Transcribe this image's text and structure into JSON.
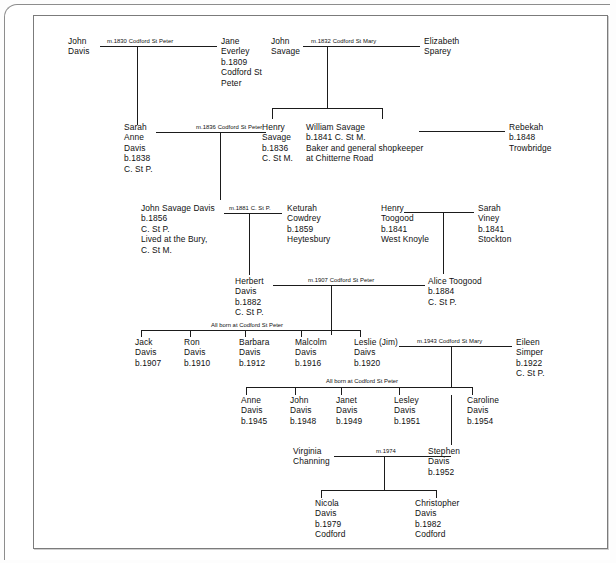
{
  "document": {
    "type": "family-tree-chart",
    "surname": "Davis",
    "title_text": ""
  },
  "generation1": {
    "john_davis": {
      "lines": [
        "John",
        "Davis"
      ]
    },
    "marriage_davis_everley": "m.1830 Codford St Peter",
    "jane_everley": {
      "lines": [
        "Jane",
        "Everley",
        "b.1809",
        "Codford St",
        "Peter"
      ]
    },
    "john_savage": {
      "lines": [
        "John",
        "Savage"
      ]
    },
    "marriage_savage_sparey": "m.1832 Codford St Mary",
    "elizabeth_sparey": {
      "lines": [
        "Elizabeth",
        "Sparey"
      ]
    }
  },
  "generation2": {
    "sarah_anne_davis": {
      "lines": [
        "Sarah",
        "Anne",
        "Davis",
        "b.1838",
        "C. St P."
      ]
    },
    "marriage_davis_savage": "m.1836 Codford St Peter",
    "henry_savage": {
      "lines": [
        "Henry",
        "Savage",
        "b.1836",
        "C. St M."
      ]
    },
    "william_savage": {
      "lines": [
        "William Savage",
        "b.1841 C. St M.",
        "Baker and general shopkeeper",
        "at Chitterne Road"
      ]
    },
    "rebekah": {
      "lines": [
        "Rebekah",
        "b.1848",
        "Trowbridge"
      ]
    }
  },
  "generation3": {
    "john_savage_davis": {
      "lines": [
        "John Savage Davis",
        "b.1856",
        "C. St P.",
        "Lived at the Bury,",
        "C. St M."
      ]
    },
    "marriage_davis_cowdrey": "m.1881 C. St P.",
    "keturah_cowdrey": {
      "lines": [
        "Keturah",
        "Cowdrey",
        "b.1859",
        "Heytesbury"
      ]
    },
    "henry_toogood": {
      "lines": [
        "Henry",
        "Toogood",
        "b.1841",
        "West Knoyle"
      ]
    },
    "sarah_viney": {
      "lines": [
        "Sarah",
        "Viney",
        "b.1841",
        "Stockton"
      ]
    }
  },
  "generation4": {
    "herbert_davis": {
      "lines": [
        "Herbert",
        "Davis",
        "b.1882",
        "C. St P."
      ]
    },
    "marriage_herbert_alice": "m.1907 Codford St Peter",
    "alice_toogood": {
      "lines": [
        "Alice Toogood",
        "b.1884",
        "C. St P."
      ]
    }
  },
  "generation5": {
    "sibling_note": "All born at Codford St Peter",
    "children": [
      {
        "lines": [
          "Jack",
          "Davis",
          "b.1907"
        ]
      },
      {
        "lines": [
          "Ron",
          "Davis",
          "b.1910"
        ]
      },
      {
        "lines": [
          "Barbara",
          "Davis",
          "b.1912"
        ]
      },
      {
        "lines": [
          "Malcolm",
          "Davis",
          "b.1916"
        ]
      },
      {
        "lines": [
          "Leslie (Jim)",
          "Daivs",
          "b.1920"
        ]
      }
    ],
    "marriage_leslie_eileen": "m.1943 Codford St Mary",
    "eileen_simper": {
      "lines": [
        "Eileen",
        "Simper",
        "b.1922",
        "C. St P."
      ]
    }
  },
  "generation6": {
    "sibling_note": "All born at Codford St Peter",
    "children": [
      {
        "lines": [
          "Anne",
          "Davis",
          "b.1945"
        ]
      },
      {
        "lines": [
          "John",
          "Davis",
          "b.1948"
        ]
      },
      {
        "lines": [
          "Janet",
          "Davis",
          "b.1949"
        ]
      },
      {
        "lines": [
          "Lesley",
          "Davis",
          "b.1951"
        ]
      },
      {
        "lines": [
          "Caroline",
          "Davis",
          "b.1954"
        ]
      }
    ]
  },
  "generation7": {
    "virginia_channing": {
      "lines": [
        "Virginia",
        "Channing"
      ]
    },
    "marriage_virginia_stephen": "m.1974",
    "stephen_davis": {
      "lines": [
        "Stephen",
        "Davis",
        "b.1952"
      ]
    }
  },
  "generation8": {
    "children": [
      {
        "lines": [
          "Nicola",
          "Davis",
          "b.1979",
          "Codford"
        ]
      },
      {
        "lines": [
          "Christopher",
          "Davis",
          "b.1982",
          "Codford"
        ]
      }
    ]
  },
  "colors": {
    "ink": "#101010",
    "line": "#1b1b1b",
    "frame": "#7b7b7b",
    "paper": "#ffffff"
  }
}
